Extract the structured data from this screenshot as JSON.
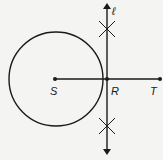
{
  "diagram": {
    "type": "geometric-construction",
    "points": [
      {
        "id": "S",
        "label": "S",
        "x": 55,
        "y": 79
      },
      {
        "id": "R",
        "label": "R",
        "x": 107,
        "y": 79
      },
      {
        "id": "T",
        "label": "T",
        "x": 160,
        "y": 79
      }
    ],
    "line": {
      "id": "l",
      "label": "ℓ",
      "x": 107,
      "y1": 5,
      "y2": 150
    },
    "segment": {
      "from": "S",
      "to": "T"
    },
    "circle": {
      "center": "S",
      "cx": 56,
      "cy": 79,
      "r": 47
    },
    "arc_marks": [
      {
        "x": 107,
        "y": 29
      },
      {
        "x": 107,
        "y": 126
      }
    ],
    "colors": {
      "stroke": "#1a1a1a",
      "background": "#f4f4f2"
    }
  },
  "labels": {
    "line_l": "ℓ",
    "point_s": "S",
    "point_r": "R",
    "point_t": "T"
  }
}
